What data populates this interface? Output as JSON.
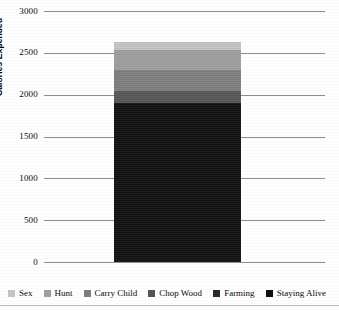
{
  "chart_data": {
    "type": "bar",
    "subtype": "stacked-bar-single-category",
    "title": "",
    "xlabel": "",
    "ylabel": "Calories Expended",
    "ylim": [
      0,
      3000
    ],
    "ytick_step": 500,
    "yticks": [
      "3000",
      "2500",
      "2000",
      "1500",
      "1000",
      "500",
      "0"
    ],
    "ytick_values": [
      3000,
      2500,
      2000,
      1500,
      1000,
      500,
      0
    ],
    "grid": true,
    "grid_axis": "y",
    "legend_position": "bottom",
    "categories": [
      "Daily Activity"
    ],
    "total": 2636,
    "series": [
      {
        "name": "Staying Alive",
        "values": [
          1900
        ],
        "color": "#0f0f0f"
      },
      {
        "name": "Farming",
        "values": [
          0
        ],
        "color": "#2b2b2b"
      },
      {
        "name": "Chop Wood",
        "values": [
          145
        ],
        "color": "#555555"
      },
      {
        "name": "Carry Child",
        "values": [
          256
        ],
        "color": "#7d7d7d"
      },
      {
        "name": "Hunt",
        "values": [
          239
        ],
        "color": "#9e9e9e"
      },
      {
        "name": "Sex",
        "values": [
          96
        ],
        "color": "#c4c4c4"
      }
    ],
    "stack_order_bottom_to_top": [
      "Staying Alive",
      "Farming",
      "Chop Wood",
      "Carry Child",
      "Hunt",
      "Sex"
    ],
    "segment_tops": [
      1900,
      1900,
      2045,
      2301,
      2540,
      2636
    ]
  },
  "legend": {
    "items": [
      {
        "label": "Sex",
        "color": "#c4c4c4"
      },
      {
        "label": "Hunt",
        "color": "#9e9e9e"
      },
      {
        "label": "Carry Child",
        "color": "#7d7d7d"
      },
      {
        "label": "Chop Wood",
        "color": "#555555"
      },
      {
        "label": "Farming",
        "color": "#2b2b2b"
      },
      {
        "label": "Staying Alive",
        "color": "#0f0f0f"
      }
    ]
  },
  "axis": {
    "y_title": "Calories Expended"
  },
  "colors": {
    "gridline": "#8d8d8d",
    "text": "#0a0a0a",
    "background": "#fefefe"
  }
}
